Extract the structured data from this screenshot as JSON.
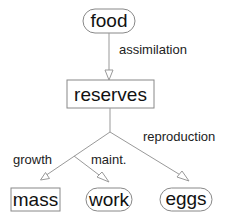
{
  "diagram": {
    "nodes": {
      "food": {
        "label": "food",
        "shape": "rounded"
      },
      "reserves": {
        "label": "reserves",
        "shape": "rect"
      },
      "mass": {
        "label": "mass",
        "shape": "rect"
      },
      "work": {
        "label": "work",
        "shape": "rounded"
      },
      "eggs": {
        "label": "eggs",
        "shape": "rounded"
      }
    },
    "edges": {
      "assimilation": {
        "label": "assimilation",
        "from": "food",
        "to": "reserves"
      },
      "growth": {
        "label": "growth",
        "from": "reserves",
        "to": "mass"
      },
      "maint": {
        "label": "maint.",
        "from": "reserves",
        "to": "work"
      },
      "reproduction": {
        "label": "reproduction",
        "from": "reserves",
        "to": "eggs"
      }
    },
    "colors": {
      "node_border": "#888888",
      "edge": "#999999",
      "text": "#111111"
    }
  }
}
